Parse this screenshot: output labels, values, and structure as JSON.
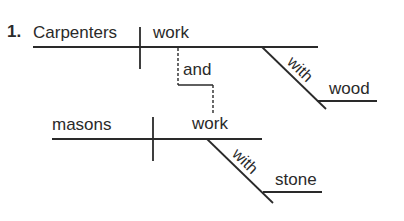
{
  "exercise": {
    "number": "1.",
    "clause1": {
      "subject": "Carpenters",
      "verb": "work",
      "modifier": {
        "preposition": "with",
        "object": "wood"
      }
    },
    "conjunction": "and",
    "clause2": {
      "subject": "masons",
      "verb": "work",
      "modifier": {
        "preposition": "with",
        "object": "stone"
      }
    }
  },
  "colors": {
    "line": "#2a2a2a",
    "background": "#ffffff"
  }
}
